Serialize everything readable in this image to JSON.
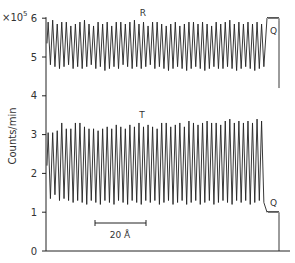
{
  "chart_data": {
    "type": "line",
    "title": "",
    "xlabel": "",
    "ylabel": "Counts/min",
    "y_multiplier_label": "×10",
    "y_multiplier_exponent": "5",
    "ylim": [
      0,
      6
    ],
    "yticks": [
      0,
      1,
      2,
      3,
      4,
      5,
      6
    ],
    "grid": false,
    "legend": "none",
    "series": [
      {
        "name": "R",
        "label": "R",
        "oscillations": 48,
        "peak_values": [
          5.9,
          5.95,
          5.85,
          5.9,
          5.9,
          5.8,
          5.85,
          5.9,
          5.95,
          5.85,
          5.8,
          5.9,
          5.85,
          5.9,
          5.8,
          5.9,
          5.9,
          5.85,
          5.9,
          5.95,
          5.85,
          5.9,
          5.8,
          5.9,
          5.9,
          5.85,
          5.8,
          5.85,
          5.9,
          5.8,
          5.85,
          5.9,
          5.9,
          5.85,
          5.9,
          5.85,
          5.8,
          5.9,
          5.85,
          5.9,
          5.95,
          5.85,
          5.9,
          5.85,
          5.9,
          5.85,
          5.9,
          5.85
        ],
        "trough_values": [
          4.8,
          4.75,
          4.7,
          4.75,
          4.8,
          4.7,
          4.75,
          4.7,
          4.75,
          4.8,
          4.7,
          4.75,
          4.65,
          4.7,
          4.75,
          4.7,
          4.8,
          4.75,
          4.7,
          4.75,
          4.7,
          4.75,
          4.8,
          4.7,
          4.75,
          4.7,
          4.65,
          4.7,
          4.75,
          4.7,
          4.65,
          4.7,
          4.75,
          4.7,
          4.65,
          4.7,
          4.75,
          4.7,
          4.7,
          4.75,
          4.7,
          4.65,
          4.7,
          4.75,
          4.7,
          4.65,
          4.7,
          4.75
        ],
        "Q_plateau": 6.0,
        "Q_label": "Q",
        "end_drop_value": 4.2
      },
      {
        "name": "T",
        "label": "T",
        "oscillations": 48,
        "peak_values": [
          3.05,
          3.05,
          3.1,
          3.3,
          3.15,
          3.15,
          3.3,
          3.3,
          3.2,
          3.15,
          3.15,
          3.1,
          3.15,
          3.2,
          3.15,
          3.25,
          3.2,
          3.15,
          3.25,
          3.2,
          3.3,
          3.2,
          3.25,
          3.2,
          3.15,
          3.3,
          3.3,
          3.2,
          3.25,
          3.3,
          3.2,
          3.35,
          3.3,
          3.25,
          3.3,
          3.35,
          3.3,
          3.3,
          3.25,
          3.35,
          3.4,
          3.3,
          3.35,
          3.3,
          3.35,
          3.3,
          3.4,
          3.35
        ],
        "trough_values": [
          1.35,
          1.45,
          1.3,
          1.35,
          1.3,
          1.25,
          1.3,
          1.25,
          1.2,
          1.3,
          1.25,
          1.2,
          1.3,
          1.25,
          1.2,
          1.3,
          1.25,
          1.2,
          1.3,
          1.25,
          1.2,
          1.3,
          1.25,
          1.3,
          1.2,
          1.25,
          1.3,
          1.2,
          1.25,
          1.3,
          1.2,
          1.25,
          1.3,
          1.2,
          1.25,
          1.3,
          1.2,
          1.25,
          1.3,
          1.25,
          1.2,
          1.3,
          1.25,
          1.3,
          1.2,
          1.25,
          1.3,
          1.25
        ],
        "Q_plateau": 1.0,
        "Q_label": "Q",
        "end_drop_value": 0.0
      }
    ],
    "annotations": [
      {
        "text": "R",
        "role": "series-label"
      },
      {
        "text": "T",
        "role": "series-label"
      },
      {
        "text": "Q",
        "role": "region-label"
      },
      {
        "text": "Q",
        "role": "region-label"
      },
      {
        "text": "20 Å",
        "role": "scale-bar"
      }
    ],
    "scale_bar": {
      "label": "20 Å"
    }
  },
  "layout": {
    "axis_x": 46,
    "y0_px": 251,
    "px_per_unit": 38.8,
    "osc_start_x": 47,
    "osc_end_x": 265,
    "q_start_x": 267,
    "q_end_x": 278,
    "drop_x": 279,
    "x_axis_end": 290,
    "scale_bar": {
      "x1": 95,
      "x2": 146,
      "y": 223
    },
    "line_color": "#222222"
  }
}
